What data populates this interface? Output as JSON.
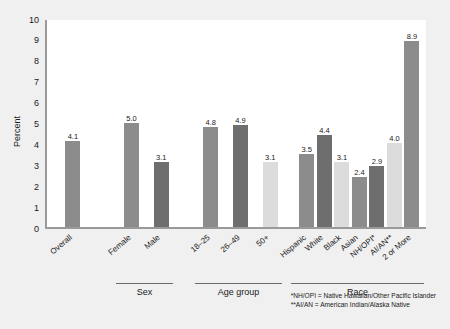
{
  "chart_data": {
    "type": "bar",
    "title": "",
    "xlabel": "",
    "ylabel": "Percent",
    "ylim": [
      0,
      10
    ],
    "ytick_labels": [
      "0",
      "1",
      "2",
      "3",
      "4",
      "5",
      "6",
      "7",
      "8",
      "9",
      "10"
    ],
    "grid": false,
    "legend": "none",
    "categories": [
      "Overall",
      "Female",
      "Male",
      "18–25",
      "26–49",
      "50+",
      "Hispanic",
      "White",
      "Black",
      "Asian",
      "NH/OPI*",
      "AI/AN**",
      "2 or More"
    ],
    "values": [
      4.1,
      5.0,
      3.1,
      4.8,
      4.9,
      3.1,
      3.5,
      4.4,
      3.1,
      2.4,
      2.9,
      4.0,
      8.9
    ],
    "value_labels": [
      "4.1",
      "5.0",
      "3.1",
      "4.8",
      "4.9",
      "3.1",
      "3.5",
      "4.4",
      "3.1",
      "2.4",
      "2.9",
      "4.0",
      "8.9"
    ],
    "bar_colors": [
      "#8c8c8c",
      "#8c8c8c",
      "#6e6e6e",
      "#8c8c8c",
      "#6e6e6e",
      "#dcdcdc",
      "#8c8c8c",
      "#6e6e6e",
      "#dcdcdc",
      "#8c8c8c",
      "#6e6e6e",
      "#dcdcdc",
      "#8c8c8c"
    ],
    "groups": [
      {
        "label": "Sex",
        "members": [
          "Female",
          "Male"
        ]
      },
      {
        "label": "Age group",
        "members": [
          "18–25",
          "26–49",
          "50+"
        ]
      },
      {
        "label": "Race",
        "members": [
          "Hispanic",
          "White",
          "Black",
          "Asian",
          "NH/OPI*",
          "AI/AN**",
          "2 or More"
        ]
      }
    ],
    "annotations": [
      "*NH/OPI = Native Hawaiian/Other Pacific Islander",
      "**AI/AN = American Indian/Alaska Native"
    ]
  },
  "colors": {
    "page_background": "#f0f0f0",
    "plot_background": "#ffffff",
    "axis": "#9a9a9a",
    "text": "#1a1a1a",
    "bar_medium": "#8c8c8c",
    "bar_dark": "#6e6e6e",
    "bar_light": "#dcdcdc"
  }
}
